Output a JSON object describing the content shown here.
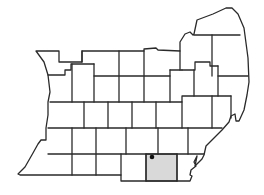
{
  "map": {
    "type": "county locator map",
    "highlighted_region": {
      "fill": "#d9d9d9",
      "rect": [
        146,
        154,
        177,
        181
      ]
    },
    "location_marker": {
      "x": 152,
      "y": 157,
      "color": "#111111"
    },
    "outline_color": "#2a2a2a",
    "background_color": "#ffffff"
  }
}
